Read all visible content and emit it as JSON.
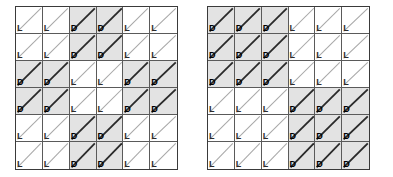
{
  "figure": {
    "cell_states": [
      "L",
      "D"
    ],
    "labels": {
      "light": "L",
      "dark": "D"
    },
    "colors": {
      "background": "#ffffff",
      "dark_cell_fill": "#e3e3e3",
      "light_cell_fill": "#ffffff",
      "grid_line": "#5a5a5a",
      "outer_border": "#3a3a3a",
      "dark_diagonal": "#2a2a2a",
      "light_diagonal": "#a8a8a8",
      "label_text": "#111111"
    }
  },
  "grids": [
    {
      "name": "left-grid",
      "rows": 6,
      "cols": 6,
      "pattern_name": "block-checkerboard",
      "cells": [
        [
          "L",
          "L",
          "D",
          "D",
          "L",
          "L"
        ],
        [
          "L",
          "L",
          "D",
          "D",
          "L",
          "L"
        ],
        [
          "D",
          "D",
          "L",
          "L",
          "D",
          "D"
        ],
        [
          "D",
          "D",
          "L",
          "L",
          "D",
          "D"
        ],
        [
          "L",
          "L",
          "D",
          "D",
          "L",
          "L"
        ],
        [
          "L",
          "L",
          "D",
          "D",
          "L",
          "L"
        ]
      ]
    },
    {
      "name": "right-grid",
      "rows": 6,
      "cols": 6,
      "pattern_name": "quadrant",
      "cells": [
        [
          "D",
          "D",
          "D",
          "L",
          "L",
          "L"
        ],
        [
          "D",
          "D",
          "D",
          "L",
          "L",
          "L"
        ],
        [
          "D",
          "D",
          "D",
          "L",
          "L",
          "L"
        ],
        [
          "L",
          "L",
          "L",
          "D",
          "D",
          "D"
        ],
        [
          "L",
          "L",
          "L",
          "D",
          "D",
          "D"
        ],
        [
          "L",
          "L",
          "L",
          "D",
          "D",
          "D"
        ]
      ]
    }
  ]
}
